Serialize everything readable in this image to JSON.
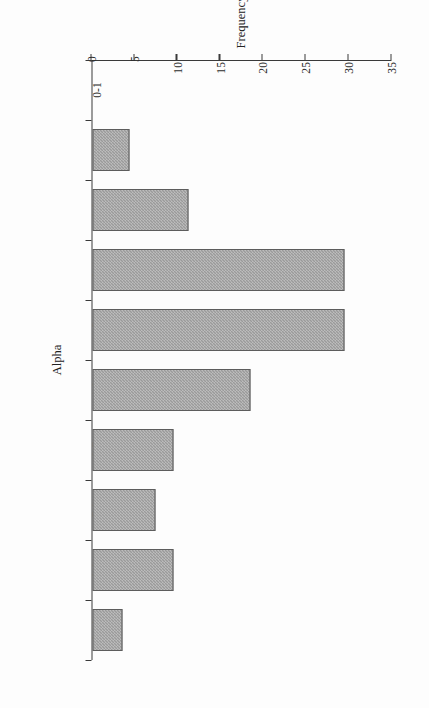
{
  "figure": {
    "background_color": "#fdfdfd",
    "bar_fill_color": "#9a9a9a",
    "bar_border_color": "#5d5d5d",
    "axis_color": "#3a3a3a",
    "text_color": "#232323",
    "rotation_degrees": 90
  },
  "chart_data": {
    "type": "bar",
    "title": "",
    "subtitle": "",
    "xlabel": "Alpha",
    "ylabel": "Frequency",
    "orientation": "vertical-bars-rotated-90",
    "categories": [
      "0-1",
      "1-2",
      "2-3",
      "3-4",
      "4-5",
      "4-6",
      "6-7",
      "7-8",
      "8-9",
      "9-10"
    ],
    "values": [
      0,
      4.3,
      11.2,
      29.3,
      29.3,
      18.4,
      9.4,
      7.3,
      9.4,
      3.4
    ],
    "bars": [
      {
        "category": "0-1",
        "value": 0
      },
      {
        "category": "1-2",
        "value": 4.3
      },
      {
        "category": "2-3",
        "value": 11.2
      },
      {
        "category": "3-4",
        "value": 29.3
      },
      {
        "category": "4-5",
        "value": 29.3
      },
      {
        "category": "4-6",
        "value": 18.4
      },
      {
        "category": "6-7",
        "value": 9.4
      },
      {
        "category": "7-8",
        "value": 7.3
      },
      {
        "category": "8-9",
        "value": 9.4
      },
      {
        "category": "9-10",
        "value": 3.4
      }
    ],
    "ylim": [
      0,
      35
    ],
    "yticks": [
      0,
      5,
      10,
      15,
      20,
      25,
      30,
      35
    ],
    "ytick_labels": [
      "0",
      "5",
      "10",
      "15",
      "20",
      "25",
      "30",
      "35"
    ],
    "xtick_labels": [
      "0-1",
      "1-2",
      "2-3",
      "3-4",
      "4-5",
      "4-6",
      "6-7",
      "7-8",
      "8-9",
      "9-10"
    ],
    "grid": false,
    "legend": null,
    "legend_position": "none",
    "annotations": []
  }
}
